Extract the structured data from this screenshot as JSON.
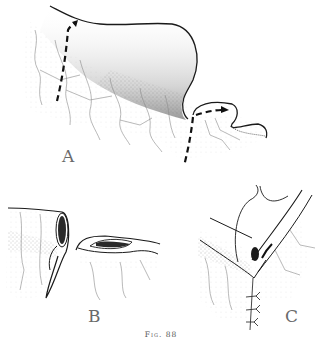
{
  "figure": {
    "caption": "Fig. 88",
    "panels": [
      {
        "id": "A",
        "label": "A",
        "description": "Bowel loop with dashed incision lines and direction arrows"
      },
      {
        "id": "B",
        "label": "B",
        "description": "Divided bowel ends with opened lumens"
      },
      {
        "id": "C",
        "label": "C",
        "description": "Anastomosis with suture line"
      }
    ]
  },
  "colors": {
    "ink": "#1a1a1a",
    "stipple": "#7a7a7a",
    "vessel": "#9a9a9a",
    "label": "#6a6a6a",
    "background": "#ffffff"
  }
}
